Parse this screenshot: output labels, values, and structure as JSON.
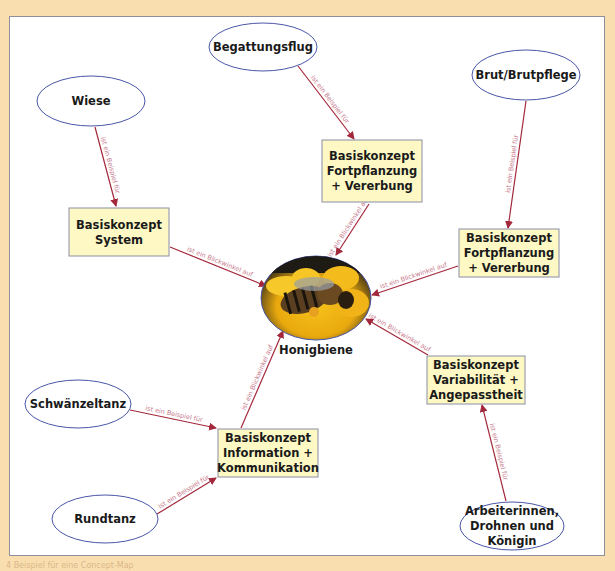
{
  "colors": {
    "background": "#f9dfb0",
    "panel": "#ffffff",
    "ellipse_stroke": "#4a56a8",
    "box_fill": "#fdf8c4",
    "box_stroke": "#8a8ea6",
    "arrow": "#a4283c",
    "edge_label": "#c77a8c"
  },
  "center": {
    "id": "honigbiene",
    "label": "Honigbiene",
    "image": "bee-on-flower-photo"
  },
  "examples": [
    {
      "id": "wiese",
      "lines": [
        "Wiese"
      ]
    },
    {
      "id": "begattungsflug",
      "lines": [
        "Begattungsflug"
      ]
    },
    {
      "id": "brut",
      "lines": [
        "Brut/Brutpflege"
      ]
    },
    {
      "id": "schwaenzeltanz",
      "lines": [
        "Schwänzeltanz"
      ]
    },
    {
      "id": "rundtanz",
      "lines": [
        "Rundtanz"
      ]
    },
    {
      "id": "arbeiterinnen",
      "lines": [
        "Arbeiterinnen,",
        "Drohnen und",
        "Königin"
      ]
    }
  ],
  "concepts": [
    {
      "id": "system",
      "lines": [
        "Basiskonzept",
        "System"
      ]
    },
    {
      "id": "fortpflanzung1",
      "lines": [
        "Basiskonzept",
        "Fortpflanzung",
        "+ Vererbung"
      ]
    },
    {
      "id": "fortpflanzung2",
      "lines": [
        "Basiskonzept",
        "Fortpflanzung",
        "+ Vererbung"
      ]
    },
    {
      "id": "variabilitaet",
      "lines": [
        "Basiskonzept",
        "Variabilität +",
        "Angepasstheit"
      ]
    },
    {
      "id": "information",
      "lines": [
        "Basiskonzept",
        "Information +",
        "Kommunikation"
      ]
    }
  ],
  "edges": [
    {
      "from": "wiese",
      "to": "system",
      "label": "ist ein Beispiel für"
    },
    {
      "from": "begattungsflug",
      "to": "fortpflanzung1",
      "label": "ist ein Beispiel für"
    },
    {
      "from": "brut",
      "to": "fortpflanzung2",
      "label": "ist ein Beispiel für"
    },
    {
      "from": "schwaenzeltanz",
      "to": "information",
      "label": "ist ein Beispiel für"
    },
    {
      "from": "rundtanz",
      "to": "information",
      "label": "ist ein Beispiel für"
    },
    {
      "from": "arbeiterinnen",
      "to": "variabilitaet",
      "label": "ist ein Beispiel für"
    },
    {
      "from": "system",
      "to": "honigbiene",
      "label": "ist ein Blickwinkel auf"
    },
    {
      "from": "fortpflanzung1",
      "to": "honigbiene",
      "label": "ist ein Blickwinkel auf"
    },
    {
      "from": "fortpflanzung2",
      "to": "honigbiene",
      "label": "ist ein Blickwinkel auf"
    },
    {
      "from": "variabilitaet",
      "to": "honigbiene",
      "label": "ist ein Blickwinkel auf"
    },
    {
      "from": "information",
      "to": "honigbiene",
      "label": "ist ein Blickwinkel auf"
    }
  ],
  "caption": "4 Beispiel für eine Concept-Map"
}
